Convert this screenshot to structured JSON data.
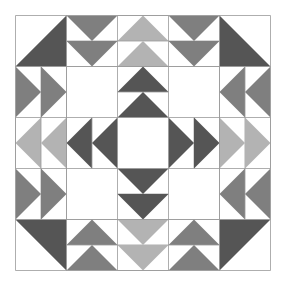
{
  "figure": {
    "type": "quilt-block",
    "grid": {
      "rows": 5,
      "cols": 5,
      "cell_px": 51
    },
    "colors": {
      "background": "#ffffff",
      "dark": "#555555",
      "mid": "#7f7f7f",
      "light": "#b3b3b3",
      "seam": "#999999"
    },
    "cells": [
      [
        {
          "kind": "half",
          "fill": "dark",
          "corner": "br"
        },
        {
          "kind": "geese",
          "fill": "mid",
          "dir": "down"
        },
        {
          "kind": "geese",
          "fill": "light",
          "dir": "up"
        },
        {
          "kind": "geese",
          "fill": "mid",
          "dir": "down"
        },
        {
          "kind": "half",
          "fill": "dark",
          "corner": "bl"
        }
      ],
      [
        {
          "kind": "geese",
          "fill": "mid",
          "dir": "right"
        },
        {
          "kind": "blank"
        },
        {
          "kind": "geese",
          "fill": "dark",
          "dir": "up"
        },
        {
          "kind": "blank"
        },
        {
          "kind": "geese",
          "fill": "mid",
          "dir": "left"
        }
      ],
      [
        {
          "kind": "geese",
          "fill": "light",
          "dir": "left"
        },
        {
          "kind": "geese",
          "fill": "dark",
          "dir": "left"
        },
        {
          "kind": "blank"
        },
        {
          "kind": "geese",
          "fill": "dark",
          "dir": "right"
        },
        {
          "kind": "geese",
          "fill": "light",
          "dir": "right"
        }
      ],
      [
        {
          "kind": "geese",
          "fill": "mid",
          "dir": "right"
        },
        {
          "kind": "blank"
        },
        {
          "kind": "geese",
          "fill": "dark",
          "dir": "down"
        },
        {
          "kind": "blank"
        },
        {
          "kind": "geese",
          "fill": "mid",
          "dir": "left"
        }
      ],
      [
        {
          "kind": "half",
          "fill": "dark",
          "corner": "tr"
        },
        {
          "kind": "geese",
          "fill": "mid",
          "dir": "up"
        },
        {
          "kind": "geese",
          "fill": "light",
          "dir": "down"
        },
        {
          "kind": "geese",
          "fill": "mid",
          "dir": "up"
        },
        {
          "kind": "half",
          "fill": "dark",
          "corner": "tl"
        }
      ]
    ]
  },
  "caption": ""
}
